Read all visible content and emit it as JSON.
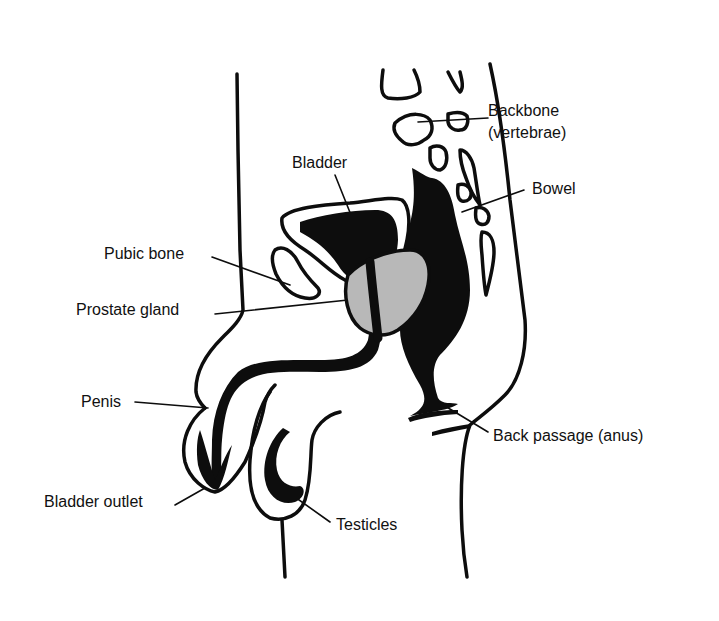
{
  "diagram": {
    "colors": {
      "ink": "#0d0d0d",
      "prostate": "#b8b8b8",
      "background": "#ffffff"
    },
    "labels": {
      "backbone": "Backbone",
      "backbone_sub": "(vertebrae)",
      "bladder": "Bladder",
      "bowel": "Bowel",
      "pubic_bone": "Pubic bone",
      "prostate": "Prostate gland",
      "penis": "Penis",
      "back_passage": "Back passage (anus)",
      "bladder_outlet": "Bladder outlet",
      "testicles": "Testicles"
    }
  }
}
